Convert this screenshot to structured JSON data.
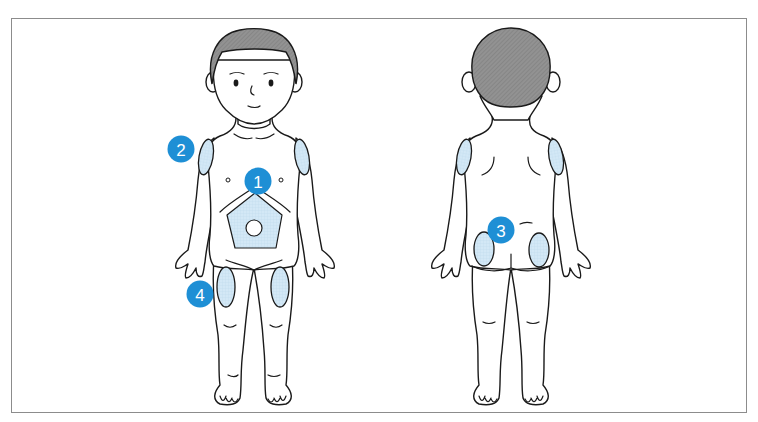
{
  "diagram": {
    "type": "injection-site-illustration",
    "views": [
      {
        "id": "front",
        "label": "front-view"
      },
      {
        "id": "back",
        "label": "back-view"
      }
    ],
    "sites": [
      {
        "number": "1",
        "region": "abdomen",
        "view": "front"
      },
      {
        "number": "2",
        "region": "upper-arm",
        "view": "front"
      },
      {
        "number": "3",
        "region": "buttocks",
        "view": "back"
      },
      {
        "number": "4",
        "region": "thigh",
        "view": "front"
      }
    ],
    "badges": {
      "b1": "1",
      "b2": "2",
      "b3": "3",
      "b4": "4"
    },
    "colors": {
      "badge": "#1e8fd5",
      "patch": "#d3e8f6",
      "hair": "#8e8e8e",
      "outline": "#1a1a1a",
      "frame": "#8c8c8c"
    }
  }
}
